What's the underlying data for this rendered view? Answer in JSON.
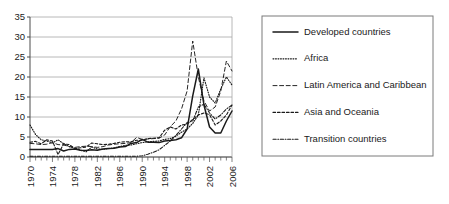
{
  "chart_data": {
    "type": "line",
    "title": "",
    "xlabel": "",
    "ylabel": "",
    "xlim": [
      1970,
      2006
    ],
    "ylim": [
      0,
      35
    ],
    "yticks": [
      0,
      5,
      10,
      15,
      20,
      25,
      30,
      35
    ],
    "xticks": [
      1970,
      1974,
      1978,
      1982,
      1986,
      1990,
      1994,
      1998,
      2002,
      2006
    ],
    "x_minor_tick_interval": 1,
    "grid": "horizontal",
    "legend_position": "right-outside",
    "x": [
      1970,
      1971,
      1972,
      1973,
      1974,
      1975,
      1976,
      1977,
      1978,
      1979,
      1980,
      1981,
      1982,
      1983,
      1984,
      1985,
      1986,
      1987,
      1988,
      1989,
      1990,
      1991,
      1992,
      1993,
      1994,
      1995,
      1996,
      1997,
      1998,
      1999,
      2000,
      2001,
      2002,
      2003,
      2004,
      2005,
      2006
    ],
    "series": [
      {
        "name": "Developed countries",
        "dash": "solid",
        "values": [
          1.9,
          1.9,
          1.9,
          1.9,
          1.9,
          2.1,
          1.5,
          1.9,
          2.0,
          1.7,
          1.6,
          1.8,
          1.7,
          2.0,
          2.1,
          2.2,
          2.5,
          2.6,
          3.4,
          3.6,
          4.4,
          3.7,
          3.7,
          3.6,
          4.0,
          4.1,
          4.3,
          4.8,
          7.0,
          15.3,
          22.0,
          13.0,
          7.5,
          6.0,
          6.0,
          9.0,
          11.5
        ]
      },
      {
        "name": "Africa",
        "dash": "dotted",
        "values": [
          8.0,
          5.6,
          4.3,
          4.0,
          3.5,
          4.3,
          3.3,
          2.6,
          2.2,
          1.7,
          1.3,
          2.5,
          2.0,
          1.9,
          2.1,
          2.3,
          2.6,
          2.9,
          3.0,
          3.3,
          3.6,
          3.8,
          3.9,
          4.0,
          4.4,
          4.6,
          5.2,
          6.2,
          7.0,
          8.4,
          10.5,
          19.8,
          15.0,
          13.5,
          17.0,
          20.0,
          18.0
        ]
      },
      {
        "name": "Latin America and Caribbean",
        "dash": "longdash",
        "values": [
          3.4,
          3.3,
          3.1,
          3.2,
          3.6,
          3.1,
          3.0,
          2.6,
          2.4,
          2.6,
          2.7,
          2.6,
          2.4,
          2.6,
          3.0,
          3.2,
          3.3,
          3.4,
          3.6,
          4.9,
          4.4,
          4.5,
          4.6,
          4.7,
          5.5,
          7.6,
          9.0,
          12.0,
          16.5,
          29.0,
          20.0,
          14.0,
          11.5,
          12.5,
          16.5,
          24.0,
          21.5
        ]
      },
      {
        "name": "Asia and Oceania",
        "dash": "dashed",
        "values": [
          3.7,
          3.9,
          3.3,
          4.3,
          4.0,
          0.6,
          3.3,
          3.1,
          2.1,
          2.3,
          2.5,
          3.5,
          3.3,
          3.1,
          3.2,
          3.4,
          3.7,
          3.8,
          3.8,
          4.2,
          4.2,
          4.6,
          4.7,
          4.8,
          6.7,
          7.5,
          7.0,
          8.0,
          8.2,
          9.4,
          10.5,
          11.0,
          10.6,
          8.0,
          9.0,
          10.5,
          13.0
        ]
      },
      {
        "name": "Transition countries",
        "dash": "dashdot",
        "values": [
          0.2,
          0.2,
          0.2,
          0.2,
          0.2,
          0.2,
          0.2,
          0.2,
          0.2,
          0.2,
          0.2,
          0.2,
          0.2,
          0.2,
          0.2,
          0.2,
          0.2,
          0.2,
          0.2,
          0.2,
          0.3,
          0.7,
          1.2,
          1.8,
          2.9,
          4.0,
          5.4,
          7.0,
          8.6,
          9.0,
          12.5,
          13.2,
          11.0,
          9.5,
          10.5,
          12.0,
          13.0
        ]
      }
    ]
  },
  "legend": {
    "items": [
      {
        "label": "Developed countries",
        "dash": "solid"
      },
      {
        "label": "Africa",
        "dash": "dotted"
      },
      {
        "label": "Latin America and Caribbean",
        "dash": "longdash"
      },
      {
        "label": "Asia and Oceania",
        "dash": "dashed"
      },
      {
        "label": "Transition countries",
        "dash": "dashdot"
      }
    ]
  }
}
